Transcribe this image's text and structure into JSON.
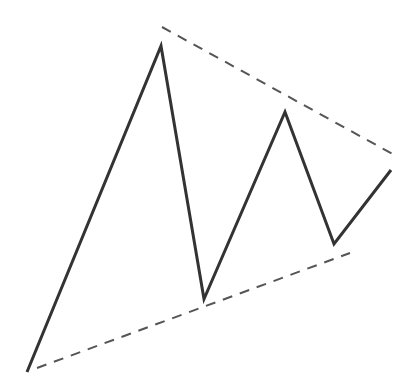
{
  "diagram": {
    "type": "symmetrical-triangle-pattern",
    "background": "#ffffff",
    "price_path": {
      "color": "#333333",
      "width": 3,
      "points": [
        [
          27,
          372
        ],
        [
          161,
          46
        ],
        [
          204,
          299
        ],
        [
          285,
          112
        ],
        [
          334,
          244
        ],
        [
          391,
          170
        ]
      ]
    },
    "upper_trendline": {
      "color": "#555555",
      "width": 2,
      "dash": "10,8",
      "from": [
        162,
        27
      ],
      "to": [
        398,
        157
      ]
    },
    "lower_trendline": {
      "color": "#555555",
      "width": 2,
      "dash": "10,8",
      "from": [
        37,
        368
      ],
      "to": [
        350,
        253
      ]
    }
  }
}
